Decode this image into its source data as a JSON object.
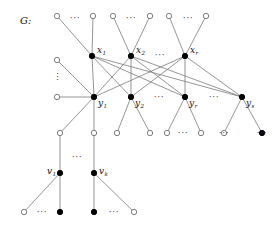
{
  "figure": {
    "name": "graph-G",
    "caption_label": "G:",
    "width": 277,
    "height": 230,
    "background": "#ffffff",
    "edge_color": "#7a7a7a",
    "node_fill_color": "#000000",
    "node_open_color": "#ffffff",
    "node_stroke_color": "#6f6f6f",
    "label_color": "#111111"
  },
  "labels": {
    "g": "G:",
    "x1": {
      "base": "x",
      "sub": "1"
    },
    "x2": {
      "base": "x",
      "sub": "2"
    },
    "xr": {
      "base": "x",
      "sub": "r"
    },
    "y1": {
      "base": "y",
      "sub": "1"
    },
    "y2": {
      "base": "y",
      "sub": "2"
    },
    "yr": {
      "base": "y",
      "sub": "r"
    },
    "ys": {
      "base": "y",
      "sub": "s"
    },
    "v1": {
      "base": "v",
      "sub": "1"
    },
    "vk": {
      "base": "v",
      "sub": "k"
    }
  },
  "ellipses": {
    "horizontal_glyph": "···",
    "vertical_glyph": "⋮",
    "positions": [
      {
        "id": "top-dots-1",
        "x": 75,
        "y": 21,
        "kind": "horizontal"
      },
      {
        "id": "top-dots-2",
        "x": 131,
        "y": 21,
        "kind": "horizontal"
      },
      {
        "id": "top-dots-3",
        "x": 188,
        "y": 21,
        "kind": "horizontal"
      },
      {
        "id": "x-row-dots",
        "x": 160,
        "y": 58,
        "kind": "horizontal"
      },
      {
        "id": "left-vdots",
        "x": 57,
        "y": 80,
        "kind": "vertical"
      },
      {
        "id": "y-row-dots-1",
        "x": 159,
        "y": 100,
        "kind": "horizontal"
      },
      {
        "id": "y-row-dots-2",
        "x": 214,
        "y": 100,
        "kind": "horizontal"
      },
      {
        "id": "bottom4-dots-1",
        "x": 183,
        "y": 136,
        "kind": "horizontal"
      },
      {
        "id": "bottom4-dots-2",
        "x": 224,
        "y": 136,
        "kind": "horizontal"
      },
      {
        "id": "bottom4-dots-3",
        "x": 262,
        "y": 136,
        "kind": "horizontal"
      },
      {
        "id": "v-row-dots",
        "x": 77,
        "y": 160,
        "kind": "horizontal"
      },
      {
        "id": "bottom-dots-1",
        "x": 42,
        "y": 215,
        "kind": "horizontal"
      },
      {
        "id": "bottom-dots-2",
        "x": 114,
        "y": 215,
        "kind": "horizontal"
      }
    ]
  },
  "nodes": {
    "top_row": [
      {
        "id": "t1",
        "x": 57,
        "y": 16,
        "type": "open"
      },
      {
        "id": "t2",
        "x": 93,
        "y": 16,
        "type": "open"
      },
      {
        "id": "t3",
        "x": 113,
        "y": 16,
        "type": "open"
      },
      {
        "id": "t4",
        "x": 150,
        "y": 16,
        "type": "open"
      },
      {
        "id": "t5",
        "x": 169,
        "y": 16,
        "type": "open"
      },
      {
        "id": "t6",
        "x": 206,
        "y": 16,
        "type": "open"
      }
    ],
    "left_column": [
      {
        "id": "l1",
        "x": 57,
        "y": 60,
        "type": "open"
      },
      {
        "id": "l2",
        "x": 57,
        "y": 97,
        "type": "open"
      }
    ],
    "x_row": [
      {
        "id": "x1",
        "x": 92,
        "y": 56,
        "type": "filled",
        "label": "x1"
      },
      {
        "id": "x2",
        "x": 131,
        "y": 56,
        "type": "filled",
        "label": "x2"
      },
      {
        "id": "xr",
        "x": 185,
        "y": 56,
        "type": "filled",
        "label": "xr"
      }
    ],
    "y_row": [
      {
        "id": "y1",
        "x": 94,
        "y": 97,
        "type": "filled",
        "label": "y1"
      },
      {
        "id": "y2",
        "x": 131,
        "y": 97,
        "type": "filled",
        "label": "y2"
      },
      {
        "id": "yr",
        "x": 185,
        "y": 97,
        "type": "filled",
        "label": "yr"
      },
      {
        "id": "ys",
        "x": 242,
        "y": 97,
        "type": "filled",
        "label": "ys"
      }
    ],
    "fourth_row": [
      {
        "id": "f1",
        "x": 60,
        "y": 133,
        "type": "open"
      },
      {
        "id": "f2",
        "x": 94,
        "y": 133,
        "type": "open"
      },
      {
        "id": "f3",
        "x": 117,
        "y": 133,
        "type": "open"
      },
      {
        "id": "f4",
        "x": 150,
        "y": 133,
        "type": "open"
      },
      {
        "id": "f5",
        "x": 167,
        "y": 133,
        "type": "open"
      },
      {
        "id": "f6",
        "x": 201,
        "y": 133,
        "type": "open"
      },
      {
        "id": "f7",
        "x": 224,
        "y": 133,
        "type": "open"
      },
      {
        "id": "f8",
        "x": 262,
        "y": 133,
        "type": "filled"
      }
    ],
    "v_row": [
      {
        "id": "v1",
        "x": 60,
        "y": 173,
        "type": "filled",
        "label": "v1"
      },
      {
        "id": "vk",
        "x": 94,
        "y": 173,
        "type": "filled",
        "label": "vk"
      }
    ],
    "bottom_row": [
      {
        "id": "b1",
        "x": 24,
        "y": 212,
        "type": "open"
      },
      {
        "id": "b2",
        "x": 60,
        "y": 212,
        "type": "filled"
      },
      {
        "id": "b3",
        "x": 94,
        "y": 212,
        "type": "filled"
      },
      {
        "id": "b4",
        "x": 134,
        "y": 212,
        "type": "open"
      }
    ]
  },
  "edges": [
    {
      "from": "t1",
      "to": "x1"
    },
    {
      "from": "t2",
      "to": "x1"
    },
    {
      "from": "t3",
      "to": "x2"
    },
    {
      "from": "t4",
      "to": "x2"
    },
    {
      "from": "t5",
      "to": "xr"
    },
    {
      "from": "t6",
      "to": "xr"
    },
    {
      "from": "l1",
      "to": "y1"
    },
    {
      "from": "l2",
      "to": "y1"
    },
    {
      "from": "x1",
      "to": "y1"
    },
    {
      "from": "x1",
      "to": "y2"
    },
    {
      "from": "x1",
      "to": "yr"
    },
    {
      "from": "x1",
      "to": "ys"
    },
    {
      "from": "x2",
      "to": "y1"
    },
    {
      "from": "x2",
      "to": "y2"
    },
    {
      "from": "x2",
      "to": "yr"
    },
    {
      "from": "x2",
      "to": "ys"
    },
    {
      "from": "xr",
      "to": "y1"
    },
    {
      "from": "xr",
      "to": "y2"
    },
    {
      "from": "xr",
      "to": "yr"
    },
    {
      "from": "xr",
      "to": "ys"
    },
    {
      "from": "y1",
      "to": "f1"
    },
    {
      "from": "y1",
      "to": "f2"
    },
    {
      "from": "y2",
      "to": "f3"
    },
    {
      "from": "y2",
      "to": "f4"
    },
    {
      "from": "yr",
      "to": "f5"
    },
    {
      "from": "yr",
      "to": "f6"
    },
    {
      "from": "ys",
      "to": "f7"
    },
    {
      "from": "ys",
      "to": "f8"
    },
    {
      "from": "f1",
      "to": "v1"
    },
    {
      "from": "f2",
      "to": "vk"
    },
    {
      "from": "v1",
      "to": "b1"
    },
    {
      "from": "v1",
      "to": "b2"
    },
    {
      "from": "vk",
      "to": "b3"
    },
    {
      "from": "vk",
      "to": "b4"
    }
  ]
}
